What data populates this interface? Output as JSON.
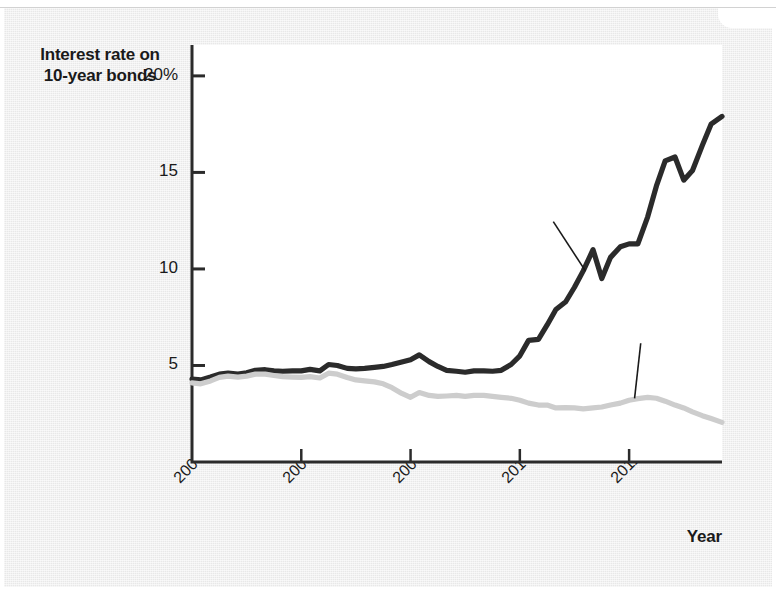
{
  "figure": {
    "background_color": "#e8e8e8",
    "plot_background_color": "#ffffff"
  },
  "axes": {
    "y_title_line1": "Interest rate on",
    "y_title_line2": "10-year bonds",
    "x_title": "Year",
    "y_ticks": [
      "20%",
      "15",
      "10",
      "5"
    ],
    "x_ticks": [
      "2007",
      "2008",
      "2009",
      "2010",
      "2011"
    ]
  },
  "chart_data": {
    "type": "line",
    "title": "Interest rate on 10-year bonds",
    "xlabel": "Year",
    "ylabel": "Interest rate on 10-year bonds",
    "xlim": [
      2007.0,
      2011.85
    ],
    "ylim": [
      0,
      21.6
    ],
    "ytick_values": [
      5,
      10,
      15,
      20
    ],
    "xtick_values": [
      2007,
      2008,
      2009,
      2010,
      2011
    ],
    "grid": false,
    "legend_position": "inline-callouts",
    "series": [
      {
        "name": "Greece",
        "color": "#2b2b2b",
        "label_color": "#111111",
        "x": [
          2007.0,
          2007.08,
          2007.17,
          2007.25,
          2007.33,
          2007.42,
          2007.5,
          2007.58,
          2007.67,
          2007.75,
          2007.83,
          2007.92,
          2008.0,
          2008.08,
          2008.17,
          2008.25,
          2008.33,
          2008.42,
          2008.5,
          2008.58,
          2008.67,
          2008.75,
          2008.83,
          2008.92,
          2009.0,
          2009.08,
          2009.17,
          2009.25,
          2009.33,
          2009.42,
          2009.5,
          2009.58,
          2009.67,
          2009.75,
          2009.83,
          2009.92,
          2010.0,
          2010.08,
          2010.17,
          2010.25,
          2010.33,
          2010.42,
          2010.5,
          2010.58,
          2010.67,
          2010.75,
          2010.83,
          2010.92,
          2011.0,
          2011.08,
          2011.17,
          2011.25,
          2011.33,
          2011.42,
          2011.5,
          2011.58,
          2011.67,
          2011.75,
          2011.85
        ],
        "y": [
          4.3,
          4.25,
          4.4,
          4.55,
          4.6,
          4.55,
          4.62,
          4.75,
          4.78,
          4.72,
          4.7,
          4.72,
          4.72,
          4.8,
          4.72,
          5.05,
          5.0,
          4.85,
          4.82,
          4.85,
          4.9,
          4.95,
          5.05,
          5.18,
          5.3,
          5.55,
          5.2,
          4.95,
          4.75,
          4.7,
          4.65,
          4.72,
          4.72,
          4.7,
          4.75,
          5.05,
          5.5,
          6.3,
          6.35,
          7.1,
          7.9,
          8.3,
          9.05,
          9.9,
          11.0,
          9.5,
          10.6,
          11.15,
          11.3,
          11.3,
          12.7,
          14.3,
          15.6,
          15.8,
          14.6,
          15.1,
          16.4,
          17.5,
          17.9
        ]
      },
      {
        "name": "Germany",
        "color": "#cdcdcd",
        "label_color": "#111111",
        "x": [
          2007.0,
          2007.08,
          2007.17,
          2007.25,
          2007.33,
          2007.42,
          2007.5,
          2007.58,
          2007.67,
          2007.75,
          2007.83,
          2007.92,
          2008.0,
          2008.08,
          2008.17,
          2008.25,
          2008.33,
          2008.42,
          2008.5,
          2008.58,
          2008.67,
          2008.75,
          2008.83,
          2008.92,
          2009.0,
          2009.08,
          2009.17,
          2009.25,
          2009.33,
          2009.42,
          2009.5,
          2009.58,
          2009.67,
          2009.75,
          2009.83,
          2009.92,
          2010.0,
          2010.08,
          2010.17,
          2010.25,
          2010.33,
          2010.42,
          2010.5,
          2010.58,
          2010.67,
          2010.75,
          2010.83,
          2010.92,
          2011.0,
          2011.08,
          2011.17,
          2011.25,
          2011.33,
          2011.42,
          2011.5,
          2011.58,
          2011.67,
          2011.75,
          2011.85
        ],
        "y": [
          4.1,
          4.05,
          4.2,
          4.38,
          4.45,
          4.4,
          4.45,
          4.55,
          4.55,
          4.48,
          4.42,
          4.4,
          4.38,
          4.42,
          4.35,
          4.6,
          4.55,
          4.38,
          4.25,
          4.2,
          4.15,
          4.05,
          3.85,
          3.55,
          3.35,
          3.6,
          3.45,
          3.4,
          3.42,
          3.45,
          3.4,
          3.45,
          3.45,
          3.4,
          3.35,
          3.3,
          3.2,
          3.05,
          2.95,
          2.95,
          2.8,
          2.82,
          2.8,
          2.75,
          2.8,
          2.85,
          2.95,
          3.05,
          3.2,
          3.28,
          3.35,
          3.3,
          3.15,
          2.95,
          2.8,
          2.6,
          2.4,
          2.25,
          2.05
        ]
      }
    ],
    "annotations": [
      {
        "text": "Greece",
        "x": 2010.05,
        "y": 13.9,
        "points_to_x": 2010.6,
        "points_to_y": 9.9
      },
      {
        "text": "Germany",
        "x": 2010.85,
        "y": 7.6,
        "points_to_x": 2011.05,
        "points_to_y": 3.3
      }
    ]
  }
}
